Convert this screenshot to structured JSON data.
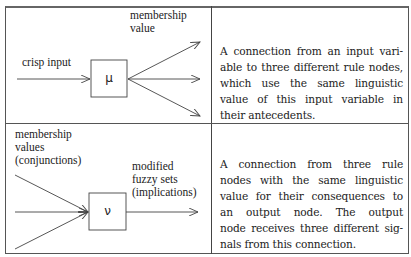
{
  "table": {
    "rows": [
      {
        "diagram": {
          "node_symbol": "μ",
          "input_label": "crisp input",
          "output_label_lines": [
            "membership",
            "value"
          ],
          "input_count": 1,
          "output_count": 3
        },
        "description_lines": [
          "A connection from an input vari-",
          "able to three different rule nodes,",
          "which use the same linguistic",
          "value of this input variable in",
          "their antecedents."
        ]
      },
      {
        "diagram": {
          "node_symbol": "ν",
          "input_label_lines": [
            "membership",
            "values",
            "(conjunctions)"
          ],
          "output_label_lines": [
            "modified",
            "fuzzy sets",
            "(implications)"
          ],
          "input_count": 3,
          "output_count": 1
        },
        "description_lines": [
          "A connection from three rule",
          "nodes with the same linguistic",
          "value for their consequences to",
          "an output node. The output",
          "node receives three different sig-",
          "nals from this connection."
        ]
      }
    ]
  },
  "colors": {
    "line": "#444444",
    "text": "#222222",
    "background": "#ffffff"
  }
}
